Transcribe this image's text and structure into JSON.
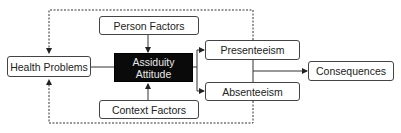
{
  "diagram": {
    "nodes": {
      "health_problems": "Health Problems",
      "person_factors": "Person Factors",
      "assiduity_attitude_line1": "Assiduity",
      "assiduity_attitude_line2": "Attitude",
      "context_factors": "Context Factors",
      "presenteeism": "Presenteeism",
      "absenteeism": "Absenteeism",
      "consequences": "Consequences"
    },
    "edges": [
      {
        "from": "Person Factors",
        "to": "Assiduity Attitude",
        "style": "solid"
      },
      {
        "from": "Context Factors",
        "to": "Assiduity Attitude",
        "style": "solid"
      },
      {
        "from": "Health Problems",
        "to": "Assiduity Attitude",
        "style": "solid"
      },
      {
        "from": "Assiduity Attitude",
        "to": "Presenteeism",
        "style": "solid"
      },
      {
        "from": "Assiduity Attitude",
        "to": "Absenteeism",
        "style": "solid"
      },
      {
        "from": "Presenteeism/Absenteeism",
        "to": "Consequences",
        "style": "solid"
      },
      {
        "from": "Presenteeism",
        "to": "Health Problems",
        "style": "dashed"
      },
      {
        "from": "Absenteeism",
        "to": "Health Problems",
        "style": "dashed"
      }
    ],
    "colors": {
      "line": "#333333",
      "dark_box": "#0a0a0a",
      "dark_text": "#e8e8e8"
    }
  }
}
